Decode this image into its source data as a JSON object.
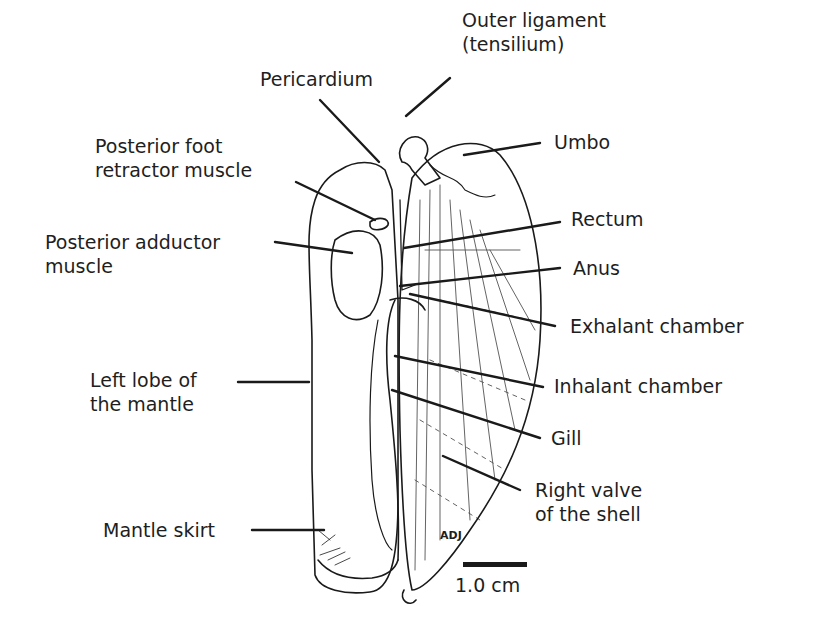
{
  "diagram": {
    "labels": {
      "outer_ligament_1": "Outer ligament",
      "outer_ligament_2": "(tensilium)",
      "pericardium": "Pericardium",
      "umbo": "Umbo",
      "posterior_foot_1": "Posterior foot",
      "posterior_foot_2": "retractor muscle",
      "rectum": "Rectum",
      "posterior_adductor_1": "Posterior adductor",
      "posterior_adductor_2": "muscle",
      "anus": "Anus",
      "exhalant_chamber": "Exhalant chamber",
      "left_lobe_1": "Left lobe of",
      "left_lobe_2": "the mantle",
      "inhalant_chamber": "Inhalant chamber",
      "gill": "Gill",
      "right_valve_1": "Right valve",
      "right_valve_2": "of the shell",
      "mantle_skirt": "Mantle skirt"
    },
    "signature": "ADJ",
    "scale_bar": {
      "label": "1.0 cm"
    }
  }
}
